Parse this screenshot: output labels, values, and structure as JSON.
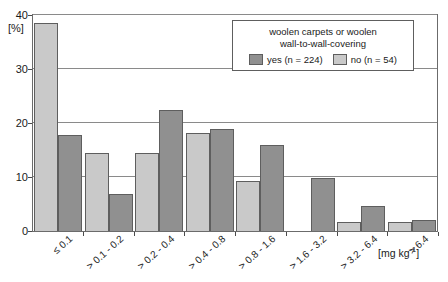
{
  "chart_data": {
    "type": "bar",
    "title": "",
    "xlabel": "[mg kg-1]",
    "ylabel": "[%]",
    "ylim": [
      0,
      40
    ],
    "yticks": [
      0,
      10,
      20,
      30,
      40
    ],
    "grid": true,
    "legend_position": "top-right",
    "legend_title_line1": "woolen carpets or woolen",
    "legend_title_line2": "wall-to-wall-covering",
    "categories": [
      "≤ 0.1",
      "> 0.1 - 0.2",
      "> 0.2 - 0.4",
      "> 0.4 - 0.8",
      "> 0.8 - 1.6",
      "> 1.6 - 3.2",
      "> 3.2 - 6.4",
      "> 6.4"
    ],
    "series": [
      {
        "name": "no (n = 54)",
        "key": "no",
        "color": "#c9c9c9",
        "values": [
          38.5,
          14.5,
          14.5,
          18.2,
          9.3,
          0,
          1.6,
          1.6
        ]
      },
      {
        "name": "yes (n = 224)",
        "key": "yes",
        "color": "#909090",
        "values": [
          17.7,
          6.9,
          22.5,
          18.9,
          15.9,
          9.8,
          4.7,
          2.0
        ]
      }
    ]
  },
  "axes": {
    "y_unit_label": "[%]",
    "x_unit_label": "[mg kg",
    "x_unit_exponent": "-1",
    "x_unit_close": "]"
  },
  "legend": {
    "title_line1": "woolen carpets or woolen",
    "title_line2": "wall-to-wall-covering",
    "entries": [
      {
        "label": "yes (n = 224)",
        "color": "#909090"
      },
      {
        "label": "no (n = 54)",
        "color": "#c9c9c9"
      }
    ]
  },
  "colors": {
    "series_yes": "#909090",
    "series_no": "#c9c9c9",
    "frame": "#6b6b6b",
    "grid": "#8a8a8a",
    "background": "#ffffff"
  }
}
